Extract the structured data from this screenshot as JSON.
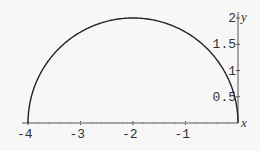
{
  "chart_data": {
    "type": "line",
    "title": "",
    "xlabel": "x",
    "ylabel": "y",
    "xlim": [
      -4,
      0
    ],
    "ylim": [
      0,
      2
    ],
    "grid": false,
    "legend": null,
    "x_ticks": [
      -4,
      -3,
      -2,
      -1
    ],
    "x_tick_labels": [
      "-4",
      "-3",
      "-2",
      "-1"
    ],
    "y_ticks": [
      0.5,
      1,
      1.5,
      2
    ],
    "y_tick_labels": [
      "0.5",
      "1",
      "1.5",
      "2"
    ],
    "series": [
      {
        "name": "semicircle",
        "x": [
          -4,
          -3.9,
          -3.75,
          -3.5,
          -3.25,
          -3,
          -2.75,
          -2.5,
          -2.25,
          -2,
          -1.75,
          -1.5,
          -1.25,
          -1,
          -0.75,
          -0.5,
          -0.25,
          -0.1,
          0
        ],
        "y": [
          0,
          0.62,
          0.97,
          1.32,
          1.56,
          1.73,
          1.85,
          1.94,
          1.98,
          2,
          1.98,
          1.94,
          1.85,
          1.73,
          1.56,
          1.32,
          0.97,
          0.62,
          0
        ]
      }
    ]
  }
}
